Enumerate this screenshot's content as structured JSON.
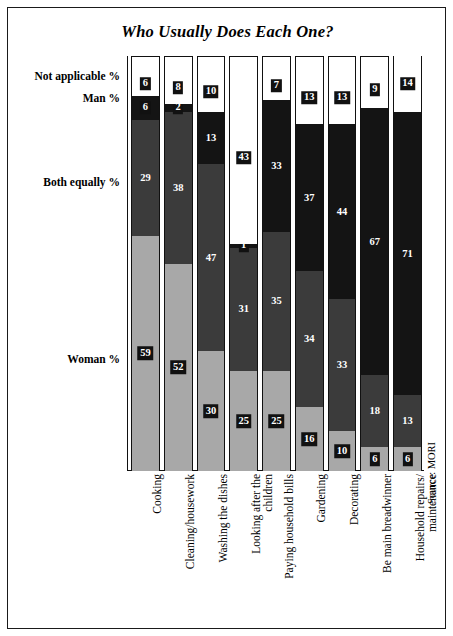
{
  "chart_data": {
    "type": "bar",
    "subtype": "stacked-100-vertical",
    "title": "Who Usually Does Each One?",
    "source": "Source: MORI",
    "xlabel": "",
    "ylabel": "",
    "ylim": [
      0,
      104
    ],
    "grid": false,
    "legend_position": "left-axis-labels",
    "axis_category_labels": [
      {
        "label": "Not applicable %",
        "top_px": 62
      },
      {
        "label": "Man %",
        "top_px": 84
      },
      {
        "label": "Both equally %",
        "top_px": 168
      },
      {
        "label": "Woman %",
        "top_px": 345
      }
    ],
    "categories": [
      "Cooking",
      "Cleaning/housework",
      "Washing the dishes",
      "Looking after the children",
      "Paying household bills",
      "Gardening",
      "Decorating",
      "Be main breadwinner",
      "Household repairs/ maintenance"
    ],
    "category_lines": [
      [
        "Cooking"
      ],
      [
        "Cleaning/housework"
      ],
      [
        "Washing the dishes"
      ],
      [
        "Looking after the",
        "children"
      ],
      [
        "Paying household bills"
      ],
      [
        "Gardening"
      ],
      [
        "Decorating"
      ],
      [
        "Be main breadwinner"
      ],
      [
        "Household repairs/",
        "maintenance"
      ]
    ],
    "series": [
      {
        "name": "Woman %",
        "color": "#a8a8a8",
        "values": [
          59,
          52,
          30,
          25,
          25,
          16,
          10,
          6,
          6
        ]
      },
      {
        "name": "Both equally %",
        "color": "#3b3b3b",
        "values": [
          29,
          38,
          47,
          31,
          35,
          34,
          33,
          18,
          13
        ]
      },
      {
        "name": "Man %",
        "color": "#141414",
        "values": [
          6,
          2,
          13,
          1,
          33,
          37,
          44,
          67,
          71
        ]
      },
      {
        "name": "Not applicable %",
        "color": "#ffffff",
        "values": [
          6,
          8,
          10,
          43,
          7,
          13,
          13,
          9,
          14
        ]
      }
    ],
    "bars": [
      {
        "category": "Cooking",
        "woman": 59,
        "both_equally": 29,
        "man": 6,
        "not_applicable": 6
      },
      {
        "category": "Cleaning/housework",
        "woman": 52,
        "both_equally": 38,
        "man": 2,
        "not_applicable": 8
      },
      {
        "category": "Washing the dishes",
        "woman": 30,
        "both_equally": 47,
        "man": 13,
        "not_applicable": 10
      },
      {
        "category": "Looking after the children",
        "woman": 25,
        "both_equally": 31,
        "man": 1,
        "not_applicable": 43
      },
      {
        "category": "Paying household bills",
        "woman": 25,
        "both_equally": 35,
        "man": 33,
        "not_applicable": 7
      },
      {
        "category": "Gardening",
        "woman": 16,
        "both_equally": 34,
        "man": 37,
        "not_applicable": 13
      },
      {
        "category": "Decorating",
        "woman": 10,
        "both_equally": 33,
        "man": 44,
        "not_applicable": 13
      },
      {
        "category": "Be main breadwinner",
        "woman": 6,
        "both_equally": 18,
        "man": 67,
        "not_applicable": 9
      },
      {
        "category": "Household repairs/ maintenance",
        "woman": 6,
        "both_equally": 13,
        "man": 71,
        "not_applicable": 14
      }
    ]
  }
}
